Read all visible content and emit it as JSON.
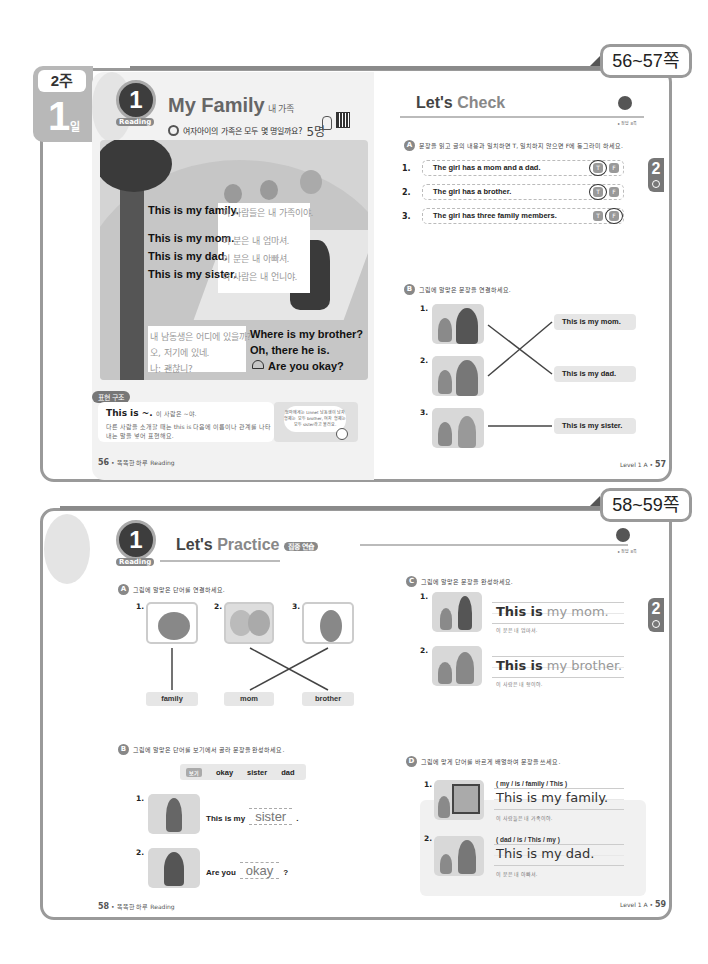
{
  "spread1": {
    "page_tab": "56~57쪽",
    "week_label": "2주",
    "day_number": "1",
    "day_unit": "일",
    "badge": {
      "number": "1",
      "unit": "일",
      "label": "Reading"
    },
    "title": "My Family",
    "title_kor": "내 가족",
    "question": "여자아이의 가족은 모두 몇 명일까요?",
    "answer": "5명",
    "story": [
      {
        "en": "This is my family.",
        "ko": "이 사람들은 내 가족이야."
      },
      {
        "en": "This is my mom.",
        "ko": "이 분은 내 엄마셔."
      },
      {
        "en": "This is my dad.",
        "ko": "이 분은 내 아빠셔."
      },
      {
        "en": "This is my sister.",
        "ko": "이 사람은 내 언니야."
      }
    ],
    "dialogue": [
      {
        "ko": "내 남동생은 어디에 있을까?",
        "en": "Where is my brother?"
      },
      {
        "ko": "오, 저기에 있네.",
        "en": "Oh, there he is."
      },
      {
        "ko": "나: 괜찮니?",
        "en": "Are you okay?"
      }
    ],
    "grammar": {
      "tag": "표현 구조",
      "title": "This is ~.",
      "title_gloss": "이 사람은 ~야.",
      "desc": "다른 사람을 소개할 때는 this is 다음에 이름이나 관계를 나타내는 말을 넣어 표현해요.",
      "tip": "엄마에게는 Linnet 남동생이 남자 형제는 모두 brother, 여자 형제는 모두 sister라고 불러요."
    },
    "footer_left": {
      "page": "56",
      "text": "똑똑한 하루 Reading"
    },
    "check": {
      "title_a": "Let's ",
      "title_b": "Check",
      "mascot_label": "▸ 정답 8쪽",
      "side_tab": "2",
      "sectionA": {
        "icon": "A",
        "instruction": "문장을 읽고 글의 내용과 일치하면 T, 일치하지 않으면 F에 동그라미 하세요.",
        "items": [
          {
            "num": "1.",
            "text": "The girl has a mom and a dad.",
            "t": "T",
            "f": "F",
            "circled": "T"
          },
          {
            "num": "2.",
            "text": "The girl has a brother.",
            "t": "T",
            "f": "F",
            "circled": "T"
          },
          {
            "num": "3.",
            "text": "The girl has three family members.",
            "t": "T",
            "f": "F",
            "circled": "F"
          }
        ]
      },
      "sectionB": {
        "icon": "B",
        "instruction": "그림에 알맞은 문장을 연결하세요.",
        "nums": [
          "1.",
          "2.",
          "3."
        ],
        "answers": [
          "This is my mom.",
          "This is my dad.",
          "This is my sister."
        ]
      },
      "footer_right": {
        "text": "Level 1 A •",
        "page": "57"
      }
    }
  },
  "spread2": {
    "page_tab": "58~59쪽",
    "badge": {
      "number": "1",
      "unit": "일",
      "label": "Reading"
    },
    "title_a": "Let's ",
    "title_b": "Practice",
    "title_tag": "집중 연습",
    "mascot_label": "▸ 정답 8쪽",
    "side_tab": "2",
    "sectionA": {
      "icon": "A",
      "instruction": "그림에 알맞은 단어를 연결하세요.",
      "nums": [
        "1.",
        "2.",
        "3."
      ],
      "words": [
        "family",
        "mom",
        "brother"
      ]
    },
    "sectionB": {
      "icon": "B",
      "instruction": "그림에 알맞은 단어를 보기에서 골라 문장을 완성하세요.",
      "bank_tag": "보기",
      "bank": [
        "okay",
        "sister",
        "dad"
      ],
      "items": [
        {
          "num": "1.",
          "before": "This is my",
          "answer": "sister",
          "after": "."
        },
        {
          "num": "2.",
          "before": "Are you",
          "answer": "okay",
          "after": "?"
        }
      ]
    },
    "sectionC": {
      "icon": "C",
      "instruction": "그림에 알맞은 문장을 완성하세요.",
      "items": [
        {
          "num": "1.",
          "given1": "This",
          "given2": "is",
          "answer": "my mom.",
          "ko": "이 분은 내 엄마셔."
        },
        {
          "num": "2.",
          "given1": "This",
          "given2": "is",
          "answer": "my brother.",
          "ko": "이 사람은 내 형이야."
        }
      ]
    },
    "sectionD": {
      "icon": "D",
      "instruction": "그림에 맞게 단어를 바르게 배열하여 문장을 쓰세요.",
      "items": [
        {
          "num": "1.",
          "scramble": "( my / is / family / This )",
          "answer": "This is my family.",
          "ko": "이 사람들은 내 가족이야."
        },
        {
          "num": "2.",
          "scramble": "( dad / is / This / my )",
          "answer": "This is my dad.",
          "ko": "이 분은 내 아빠셔."
        }
      ]
    },
    "footer_left": {
      "page": "58",
      "text": "똑똑한 하루 Reading"
    },
    "footer_right": {
      "text": "Level 1 A •",
      "page": "59"
    }
  }
}
